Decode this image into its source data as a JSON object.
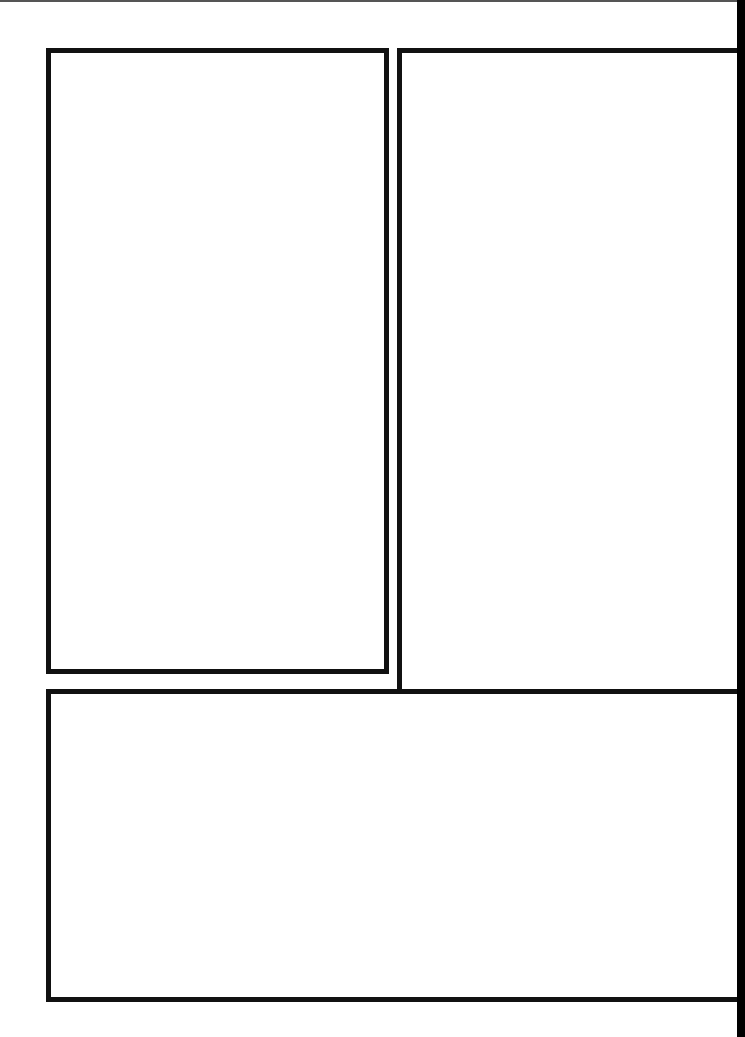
{
  "page": {
    "type": "blank comic panel layout",
    "background": "#ffffff",
    "border_color": "#111111",
    "panels": [
      {
        "id": 1,
        "label": "",
        "position": "top-left, tall"
      },
      {
        "id": 2,
        "label": "",
        "position": "top-right, L-shaped wrapping into bottom"
      },
      {
        "id": 3,
        "label": "",
        "position": "bottom, wide"
      }
    ]
  }
}
